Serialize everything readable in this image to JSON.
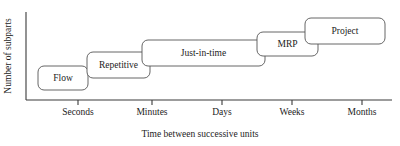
{
  "chart_data": {
    "type": "diagram",
    "title": "",
    "xlabel": "Time between successive units",
    "ylabel": "Number of subparts",
    "x_ticks": [
      {
        "label": "Seconds",
        "x": 78
      },
      {
        "label": "Minutes",
        "x": 152
      },
      {
        "label": "Days",
        "x": 222
      },
      {
        "label": "Weeks",
        "x": 292
      },
      {
        "label": "Months",
        "x": 362
      }
    ],
    "grid": false,
    "legend": "none",
    "boxes": [
      {
        "label": "Flow",
        "x": 38,
        "y": 66,
        "w": 50,
        "h": 24
      },
      {
        "label": "Repetitive",
        "x": 87,
        "y": 52,
        "w": 63,
        "h": 26
      },
      {
        "label": "Just-in-time",
        "x": 142,
        "y": 40,
        "w": 123,
        "h": 26
      },
      {
        "label": "MRP",
        "x": 257,
        "y": 32,
        "w": 61,
        "h": 24
      },
      {
        "label": "Project",
        "x": 305,
        "y": 18,
        "w": 80,
        "h": 26
      }
    ],
    "axes": {
      "y_axis_x": 26,
      "y_axis_top": 12,
      "x_axis_y": 100,
      "x_axis_right": 392,
      "tick_length": 5
    },
    "colors": {
      "axis": "#3a3a3a",
      "box_stroke": "#555555",
      "box_fill": "#ffffff",
      "text": "#1c1c1c",
      "background": "#ffffff"
    }
  }
}
